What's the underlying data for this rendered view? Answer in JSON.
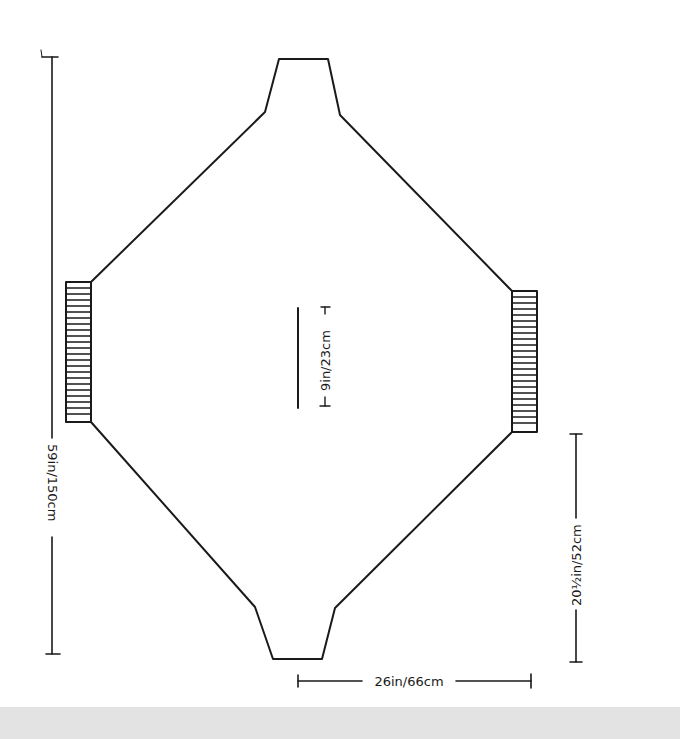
{
  "diagram": {
    "type": "knitting-schematic",
    "colors": {
      "line": "#1a1a1a",
      "background": "#ffffff",
      "bottom_band": "#e3e3e3"
    },
    "dimensions": {
      "total_length": "59in/150cm",
      "center_slit": "9in/23cm",
      "half_width": "26in/66cm",
      "side_height": "20½in/52cm"
    },
    "parts": [
      {
        "name": "body",
        "shape": "elongated octagon"
      },
      {
        "name": "left-cuff-ribbing",
        "shape": "hatched rectangle"
      },
      {
        "name": "right-cuff-ribbing",
        "shape": "hatched rectangle"
      },
      {
        "name": "top-neck-edge",
        "shape": "trapezoid"
      },
      {
        "name": "bottom-neck-edge",
        "shape": "trapezoid"
      }
    ]
  }
}
